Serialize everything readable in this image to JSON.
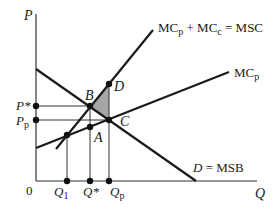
{
  "diagram": {
    "type": "externality-supply-demand",
    "axes": {
      "y_label": "P",
      "x_label": "Q",
      "origin_label": "0"
    },
    "curves": {
      "msc": {
        "label_main": "MC",
        "label_sub": "p",
        "label_mid": " + MC",
        "label_sub2": "c",
        "label_end": " = MSC"
      },
      "mcp": {
        "label_main": "MC",
        "label_sub": "p"
      },
      "demand": {
        "label_italic": "D",
        "label_rest": " = MSB"
      }
    },
    "points": {
      "A": "A",
      "B": "B",
      "C": "C",
      "D": "D"
    },
    "price_labels": {
      "p_star": "P*",
      "p_p_main": "P",
      "p_p_sub": "p"
    },
    "quantity_labels": {
      "q1_main": "Q",
      "q1_sub": "1",
      "q_star": "Q*",
      "qp_main": "Q",
      "qp_sub": "p"
    },
    "colors": {
      "line": "#1a1a1a",
      "guide": "#333333",
      "shaded_area": "#a6a6a6"
    }
  }
}
